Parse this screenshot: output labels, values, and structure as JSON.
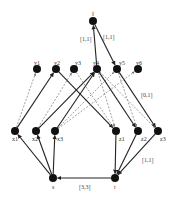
{
  "nodes": [
    {
      "id": "f",
      "label": "f",
      "x": 93,
      "y": 21,
      "lx": -1,
      "ly": -10
    },
    {
      "id": "y1",
      "label": "y1",
      "x": 37,
      "y": 69,
      "lx": -3,
      "ly": -9
    },
    {
      "id": "y2",
      "label": "y2",
      "x": 56,
      "y": 69,
      "lx": -2,
      "ly": -9
    },
    {
      "id": "y3",
      "label": "y3",
      "x": 74,
      "y": 69,
      "lx": 1,
      "ly": -9
    },
    {
      "id": "y4",
      "label": "y4",
      "x": 97,
      "y": 69,
      "lx": -4,
      "ly": -9
    },
    {
      "id": "y5",
      "label": "y5",
      "x": 117,
      "y": 69,
      "lx": 2,
      "ly": -9
    },
    {
      "id": "y6",
      "label": "y6",
      "x": 138,
      "y": 69,
      "lx": -2,
      "ly": -9
    },
    {
      "id": "x1",
      "label": "x1",
      "x": 15,
      "y": 131,
      "lx": -3,
      "ly": 5
    },
    {
      "id": "x2",
      "label": "x2",
      "x": 36,
      "y": 131,
      "lx": -4,
      "ly": 5
    },
    {
      "id": "x3",
      "label": "x3",
      "x": 55,
      "y": 131,
      "lx": 2,
      "ly": 5
    },
    {
      "id": "z1",
      "label": "z1",
      "x": 116,
      "y": 131,
      "lx": 3,
      "ly": 5
    },
    {
      "id": "z2",
      "label": "z2",
      "x": 138,
      "y": 131,
      "lx": 3,
      "ly": 5
    },
    {
      "id": "z3",
      "label": "z3",
      "x": 158,
      "y": 131,
      "lx": 2,
      "ly": 5
    },
    {
      "id": "s",
      "label": "s",
      "x": 53,
      "y": 178,
      "lx": -1,
      "ly": 6
    },
    {
      "id": "t",
      "label": "t",
      "x": 115,
      "y": 178,
      "lx": -1,
      "ly": 6
    }
  ],
  "edges": [
    {
      "from": "y4",
      "to": "f",
      "style": "solid",
      "label": "[1,1]",
      "label_x": 80,
      "label_y": 36
    },
    {
      "from": "f",
      "to": "y5",
      "style": "solid",
      "label": "[1,1]",
      "label_x": 103,
      "label_y": 34
    },
    {
      "from": "x1",
      "to": "y2",
      "style": "solid"
    },
    {
      "from": "x2",
      "to": "y4",
      "style": "solid"
    },
    {
      "from": "x3",
      "to": "y4",
      "style": "solid"
    },
    {
      "from": "y2",
      "to": "z1",
      "style": "solid"
    },
    {
      "from": "y4",
      "to": "z2",
      "style": "solid"
    },
    {
      "from": "y5",
      "to": "z3",
      "style": "solid",
      "label": "[0,1]",
      "label_x": 141,
      "label_y": 92
    },
    {
      "from": "x1",
      "to": "y1",
      "style": "dashed"
    },
    {
      "from": "x2",
      "to": "y3",
      "style": "dashed"
    },
    {
      "from": "x3",
      "to": "y5",
      "style": "dashed"
    },
    {
      "from": "x3",
      "to": "y6",
      "style": "dashed"
    },
    {
      "from": "y3",
      "to": "z1",
      "style": "dashed"
    },
    {
      "from": "y4",
      "to": "z3",
      "style": "dashed"
    },
    {
      "from": "y4",
      "to": "z1",
      "style": "dashed"
    },
    {
      "from": "y5",
      "to": "z2",
      "style": "dashed"
    },
    {
      "from": "s",
      "to": "x1",
      "style": "solid"
    },
    {
      "from": "s",
      "to": "x2",
      "style": "solid"
    },
    {
      "from": "s",
      "to": "x3",
      "style": "solid"
    },
    {
      "from": "z1",
      "to": "t",
      "style": "solid"
    },
    {
      "from": "z2",
      "to": "t",
      "style": "solid"
    },
    {
      "from": "z3",
      "to": "t",
      "style": "solid",
      "label": "[1,1]",
      "label_x": 142,
      "label_y": 157
    },
    {
      "from": "t",
      "to": "s",
      "style": "solid",
      "label": "[3,3]",
      "label_x": 79,
      "label_y": 184
    }
  ],
  "colors": {
    "node": "#111111",
    "edge": "#222222",
    "dashed_edge": "#777777",
    "background": "#ffffff"
  }
}
